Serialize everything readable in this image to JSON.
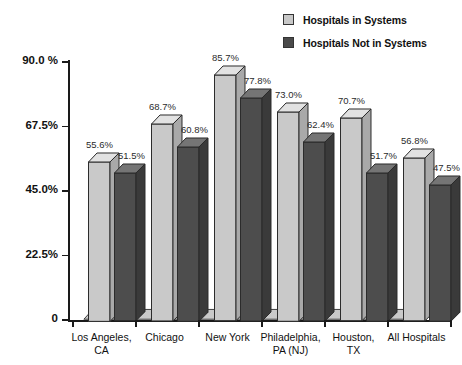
{
  "chart_data": {
    "type": "bar",
    "title": "",
    "subtitle": "",
    "xlabel": "",
    "ylabel": "",
    "categories": [
      "Los Angeles,\nCA",
      "Chicago",
      "New York",
      "Philadelphia,\nPA  (NJ)",
      "Houston,\nTX",
      "All Hospitals"
    ],
    "series": [
      {
        "name": "Hospitals in Systems",
        "color": "#c9c9c9",
        "values": [
          55.6,
          68.7,
          85.7,
          73.0,
          70.7,
          56.8
        ],
        "value_labels": [
          "55.6%",
          "68.7%",
          "85.7%",
          "73.0%",
          "70.7%",
          "56.8%"
        ]
      },
      {
        "name": "Hospitals Not in Systems",
        "color": "#4d4d4d",
        "values": [
          51.5,
          60.8,
          77.8,
          62.4,
          51.7,
          47.5
        ],
        "value_labels": [
          "51.5%",
          "60.8%",
          "77.8%",
          "62.4%",
          "51.7%",
          "47.5%"
        ]
      }
    ],
    "ylim": [
      0,
      90
    ],
    "yticks": [
      0,
      22.5,
      45.0,
      67.5,
      90.0
    ],
    "ytick_labels": [
      "0",
      "22.5%",
      "45.0%",
      "67.5%",
      "90.0 %"
    ],
    "grid": false,
    "legend_position": "top-right",
    "style": "3d-bars"
  },
  "legend": {
    "items": [
      {
        "label": "Hospitals in Systems",
        "swatch": "light"
      },
      {
        "label": "Hospitals Not in Systems",
        "swatch": "dark"
      }
    ]
  },
  "axes": {
    "ytick_labels": [
      "90.0 %",
      "67.5%",
      "45.0%",
      "22.5%",
      "0"
    ],
    "xtick_labels": [
      "Los Angeles,\nCA",
      "Chicago",
      "New York",
      "Philadelphia,\nPA  (NJ)",
      "Houston,\nTX",
      "All Hospitals"
    ]
  },
  "colors": {
    "light_bar": "#c9c9c9",
    "light_bar_top": "#e2e2e2",
    "light_bar_side": "#a9a9a9",
    "dark_bar": "#4d4d4d",
    "dark_bar_top": "#757575",
    "dark_bar_side": "#3a3a3a",
    "axis": "#1a1a1a",
    "text": "#111111",
    "background": "#ffffff"
  }
}
